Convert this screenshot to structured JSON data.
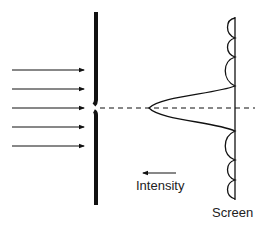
{
  "diagram": {
    "labels": {
      "intensity": "Intensity",
      "screen": "Screen"
    },
    "incident_rays": 5,
    "colors": {
      "line": "#111111",
      "background": "#ffffff"
    }
  }
}
